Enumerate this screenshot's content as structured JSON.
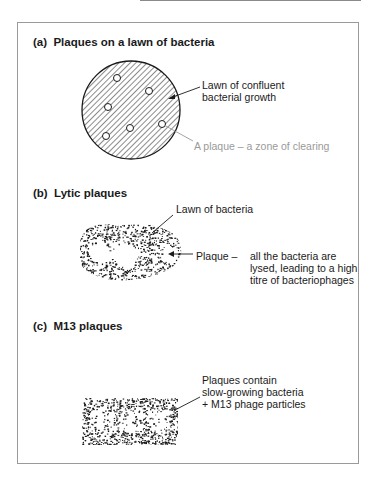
{
  "figure": {
    "panels": [
      {
        "id": "a",
        "title": "(a)  Plaques on a lawn of bacteria",
        "labels": {
          "lawn": [
            "Lawn of confluent",
            "bacterial growth"
          ],
          "plaque": "A plaque – a zone of clearing"
        }
      },
      {
        "id": "b",
        "title": "(b)  Lytic plaques",
        "labels": {
          "lawn": "Lawn of bacteria",
          "plaque_prefix": "Plaque –",
          "plaque": [
            "all the bacteria are",
            "lysed, leading to a high",
            "titre of bacteriophages"
          ]
        }
      },
      {
        "id": "c",
        "title": "(c)  M13 plaques",
        "labels": {
          "plaque": [
            "Plaques contain",
            "slow-growing bacteria",
            "+ M13 phage particles"
          ]
        }
      }
    ],
    "colors": {
      "ink": "#1a1a1a",
      "gray_label": "#9a9a9a",
      "frame": "#9a9a9a"
    }
  }
}
